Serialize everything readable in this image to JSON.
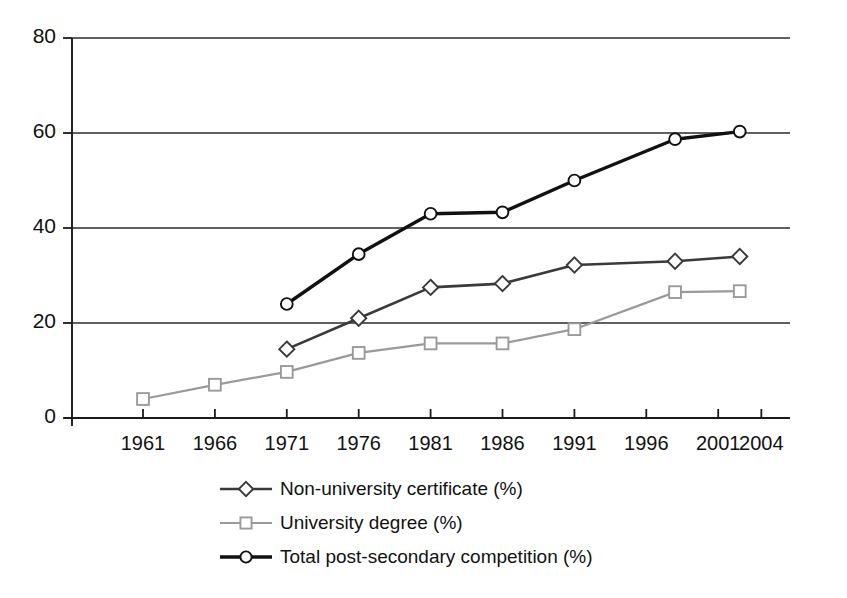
{
  "chart_data": {
    "type": "line",
    "title": "",
    "subtitle": "",
    "xlabel": "",
    "ylabel": "",
    "xlim": [
      1959.5,
      2004
    ],
    "ylim": [
      0,
      80
    ],
    "grid": true,
    "grid_axis": "y",
    "legend_position": "below",
    "x_tick_labels": [
      "1961",
      "1966",
      "1971",
      "1976",
      "1981",
      "1986",
      "1991",
      "1996",
      "2001",
      "2004"
    ],
    "y_tick_labels": [
      "0",
      "20",
      "40",
      "60",
      "80"
    ],
    "y_ticks": [
      0,
      20,
      40,
      60,
      80
    ],
    "series": [
      {
        "name": "Non-university certificate (%)",
        "marker": "diamond",
        "color": "#3a3a3a",
        "line_width": 2.6,
        "x": [
          1971,
          1976,
          1981,
          1986,
          1991,
          1998,
          2002.5
        ],
        "values": [
          14.5,
          21.0,
          27.5,
          28.3,
          32.2,
          33.0,
          34.0
        ]
      },
      {
        "name": "University degree (%)",
        "marker": "square",
        "color": "#9a9a9a",
        "line_width": 2.2,
        "x": [
          1961,
          1966,
          1971,
          1976,
          1981,
          1986,
          1991,
          1998,
          2002.5
        ],
        "values": [
          4.0,
          7.0,
          9.7,
          13.7,
          15.7,
          15.7,
          18.7,
          26.5,
          26.7
        ]
      },
      {
        "name": "Total post-secondary competition (%)",
        "marker": "circle",
        "color": "#111111",
        "line_width": 3.4,
        "x": [
          1971,
          1976,
          1981,
          1986,
          1991,
          1998,
          2002.5
        ],
        "values": [
          24.0,
          34.5,
          43.0,
          43.3,
          50.0,
          58.7,
          60.3
        ]
      }
    ]
  },
  "legend": {
    "items": [
      {
        "label": "Non-university certificate (%)",
        "marker": "diamond",
        "color": "#3a3a3a"
      },
      {
        "label": "University degree (%)",
        "marker": "square",
        "color": "#9a9a9a"
      },
      {
        "label": "Total post-secondary competition (%)",
        "marker": "circle",
        "color": "#111111"
      }
    ]
  },
  "axes": {
    "axis_color": "#1a1a1a",
    "grid_color": "#2b2b2b",
    "background": "#ffffff"
  }
}
